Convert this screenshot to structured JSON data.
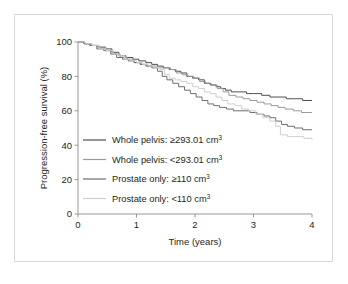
{
  "chart_data": {
    "type": "line",
    "title": "",
    "xlabel": "Time (years)",
    "ylabel": "Progression-free survival (%)",
    "xlim": [
      0,
      4
    ],
    "ylim": [
      0,
      100
    ],
    "xticks": [
      "0",
      "1",
      "2",
      "3",
      "4"
    ],
    "xtick_values": [
      0,
      1,
      2,
      3,
      4
    ],
    "yticks": [
      "0",
      "20",
      "40",
      "60",
      "80",
      "100"
    ],
    "ytick_values": [
      0,
      20,
      40,
      60,
      80,
      100
    ],
    "grid": false,
    "legend_position": "center-left",
    "curve_style": "kaplan-meier step function",
    "series": [
      {
        "name": "Whole pelvis: ≥293.01 cm³",
        "label_main": "Whole pelvis: ≥293.01 cm",
        "label_sup": "3",
        "color": "#4f4f4f",
        "final_value": 66,
        "points": [
          [
            0.0,
            100
          ],
          [
            0.1,
            99
          ],
          [
            0.22,
            98
          ],
          [
            0.34,
            97
          ],
          [
            0.46,
            96
          ],
          [
            0.58,
            94
          ],
          [
            0.7,
            92
          ],
          [
            0.82,
            91
          ],
          [
            0.94,
            90
          ],
          [
            1.04,
            89
          ],
          [
            1.16,
            88
          ],
          [
            1.26,
            87
          ],
          [
            1.36,
            86
          ],
          [
            1.46,
            85
          ],
          [
            1.56,
            84
          ],
          [
            1.66,
            83
          ],
          [
            1.76,
            82
          ],
          [
            1.86,
            80
          ],
          [
            1.96,
            79
          ],
          [
            2.06,
            78
          ],
          [
            2.16,
            76
          ],
          [
            2.26,
            75
          ],
          [
            2.36,
            74
          ],
          [
            2.44,
            73
          ],
          [
            2.52,
            72
          ],
          [
            2.62,
            71
          ],
          [
            2.74,
            71
          ],
          [
            2.88,
            70
          ],
          [
            3.0,
            70
          ],
          [
            3.14,
            69
          ],
          [
            3.28,
            68
          ],
          [
            3.42,
            68
          ],
          [
            3.56,
            67
          ],
          [
            3.7,
            67
          ],
          [
            3.84,
            66
          ],
          [
            4.0,
            66
          ]
        ]
      },
      {
        "name": "Whole pelvis: <293.01 cm³",
        "label_main": "Whole pelvis: <293.01 cm",
        "label_sup": "3",
        "color": "#9a9a9a",
        "final_value": 59,
        "points": [
          [
            0.0,
            100
          ],
          [
            0.12,
            99
          ],
          [
            0.24,
            98
          ],
          [
            0.36,
            97
          ],
          [
            0.48,
            95
          ],
          [
            0.6,
            93
          ],
          [
            0.72,
            91
          ],
          [
            0.84,
            90
          ],
          [
            0.96,
            88
          ],
          [
            1.08,
            87
          ],
          [
            1.18,
            86
          ],
          [
            1.28,
            86
          ],
          [
            1.38,
            85
          ],
          [
            1.48,
            85
          ],
          [
            1.58,
            84
          ],
          [
            1.68,
            82
          ],
          [
            1.78,
            81
          ],
          [
            1.88,
            80
          ],
          [
            1.98,
            79
          ],
          [
            2.08,
            77
          ],
          [
            2.18,
            76
          ],
          [
            2.28,
            75
          ],
          [
            2.38,
            73
          ],
          [
            2.48,
            71
          ],
          [
            2.58,
            69
          ],
          [
            2.7,
            68
          ],
          [
            2.82,
            67
          ],
          [
            2.94,
            66
          ],
          [
            3.06,
            65
          ],
          [
            3.18,
            64
          ],
          [
            3.3,
            63
          ],
          [
            3.42,
            62
          ],
          [
            3.54,
            61
          ],
          [
            3.68,
            60
          ],
          [
            3.82,
            59
          ],
          [
            4.0,
            59
          ]
        ]
      },
      {
        "name": "Prostate only: ≥110 cm³",
        "label_main": "Prostate only: ≥110 cm",
        "label_sup": "3",
        "color": "#6e6e6e",
        "final_value": 49,
        "points": [
          [
            0.0,
            100
          ],
          [
            0.1,
            99
          ],
          [
            0.2,
            98
          ],
          [
            0.32,
            96
          ],
          [
            0.44,
            95
          ],
          [
            0.56,
            93
          ],
          [
            0.66,
            91
          ],
          [
            0.76,
            90
          ],
          [
            0.86,
            89
          ],
          [
            0.96,
            88
          ],
          [
            1.06,
            87
          ],
          [
            1.16,
            86
          ],
          [
            1.26,
            85
          ],
          [
            1.36,
            83
          ],
          [
            1.44,
            80
          ],
          [
            1.52,
            78
          ],
          [
            1.62,
            76
          ],
          [
            1.72,
            74
          ],
          [
            1.82,
            72
          ],
          [
            1.92,
            70
          ],
          [
            2.02,
            68
          ],
          [
            2.12,
            66
          ],
          [
            2.22,
            64
          ],
          [
            2.32,
            63
          ],
          [
            2.42,
            62
          ],
          [
            2.54,
            61
          ],
          [
            2.66,
            60
          ],
          [
            2.8,
            60
          ],
          [
            2.94,
            59
          ],
          [
            3.06,
            58
          ],
          [
            3.18,
            57
          ],
          [
            3.28,
            56
          ],
          [
            3.38,
            54
          ],
          [
            3.48,
            52
          ],
          [
            3.58,
            51
          ],
          [
            3.7,
            50
          ],
          [
            3.84,
            49
          ],
          [
            4.0,
            49
          ]
        ]
      },
      {
        "name": "Prostate only: <110 cm³",
        "label_main": "Prostate only: <110 cm",
        "label_sup": "3",
        "color": "#cfcfcf",
        "final_value": 43,
        "points": [
          [
            0.0,
            100
          ],
          [
            0.12,
            99
          ],
          [
            0.24,
            98
          ],
          [
            0.36,
            96
          ],
          [
            0.48,
            95
          ],
          [
            0.6,
            93
          ],
          [
            0.7,
            92
          ],
          [
            0.8,
            90
          ],
          [
            0.9,
            89
          ],
          [
            1.0,
            88
          ],
          [
            1.1,
            87
          ],
          [
            1.2,
            86
          ],
          [
            1.3,
            85
          ],
          [
            1.4,
            84
          ],
          [
            1.48,
            81
          ],
          [
            1.56,
            79
          ],
          [
            1.66,
            78
          ],
          [
            1.76,
            77
          ],
          [
            1.86,
            76
          ],
          [
            1.96,
            74
          ],
          [
            2.06,
            73
          ],
          [
            2.16,
            71
          ],
          [
            2.26,
            70
          ],
          [
            2.36,
            68
          ],
          [
            2.46,
            66
          ],
          [
            2.56,
            64
          ],
          [
            2.68,
            63
          ],
          [
            2.8,
            61
          ],
          [
            2.92,
            60
          ],
          [
            3.04,
            58
          ],
          [
            3.16,
            56
          ],
          [
            3.28,
            54
          ],
          [
            3.38,
            51
          ],
          [
            3.46,
            46
          ],
          [
            3.58,
            45
          ],
          [
            3.72,
            45
          ],
          [
            3.86,
            44
          ],
          [
            4.0,
            43
          ]
        ]
      }
    ]
  },
  "axis": {
    "y_title": "Progression-free survival (%)",
    "x_title": "Time (years)"
  },
  "colors": {
    "frame": "#d8d8d8",
    "axis": "#8c8c8c",
    "text": "#231f20",
    "background": "#ffffff"
  }
}
